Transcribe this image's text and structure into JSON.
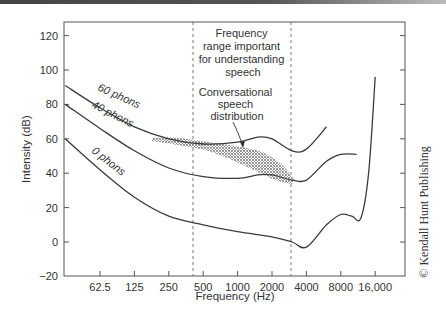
{
  "chart_data": {
    "type": "line",
    "title": "",
    "xlabel": "Frequency (Hz)",
    "ylabel": "Intensity (dB)",
    "xscale": "log2",
    "ylim": [
      -20,
      125
    ],
    "x_ticks": [
      "62.5",
      "125",
      "250",
      "500",
      "1000",
      "2000",
      "4000",
      "8000",
      "16,000"
    ],
    "y_ticks": [
      "120",
      "100",
      "80",
      "60",
      "40",
      "20",
      "0",
      "−20"
    ],
    "grid": false,
    "series": [
      {
        "name": "60 phons",
        "label": "60 phons",
        "x": [
          31,
          62.5,
          125,
          250,
          500,
          1000,
          1500,
          2000,
          3000,
          4000,
          6000
        ],
        "y": [
          91,
          78,
          67,
          60,
          57,
          58,
          61,
          60,
          53,
          54,
          67
        ]
      },
      {
        "name": "40 phons",
        "label": "40 phons",
        "x": [
          31,
          62.5,
          125,
          250,
          500,
          1000,
          1500,
          2000,
          3000,
          4000,
          6000,
          8000,
          11000
        ],
        "y": [
          80,
          66,
          53,
          43,
          38,
          37,
          39,
          39,
          36,
          36,
          47,
          51,
          51
        ]
      },
      {
        "name": "0 phons",
        "label": "0 phons",
        "x": [
          31,
          62.5,
          125,
          250,
          500,
          1000,
          2000,
          3000,
          4000,
          6000,
          8000,
          10000,
          12000,
          14000,
          16000
        ],
        "y": [
          60,
          42,
          26,
          15,
          10,
          6,
          3,
          0,
          -3,
          10,
          16,
          15,
          14,
          40,
          96
        ]
      }
    ],
    "annotations": [
      {
        "text": "Frequency range important for understanding speech",
        "type": "vertical-band",
        "x_range": [
          400,
          3500
        ]
      },
      {
        "text": "Conversational speech distribution",
        "type": "shaded-region",
        "x_range": [
          200,
          4000
        ],
        "y_range": [
          35,
          62
        ]
      }
    ]
  },
  "labels": {
    "band_annotation": [
      "Frequency",
      "range important",
      "for understanding",
      "speech"
    ],
    "speech_annotation": [
      "Conversational",
      "speech",
      "distribution"
    ],
    "curves": {
      "c60": "60 phons",
      "c40": "40 phons",
      "c0": "0 phons"
    },
    "copyright": "© Kendall Hunt Publishing"
  },
  "colors": {
    "line": "#3a3a3a",
    "axis": "#555555",
    "shade": "#888888"
  }
}
